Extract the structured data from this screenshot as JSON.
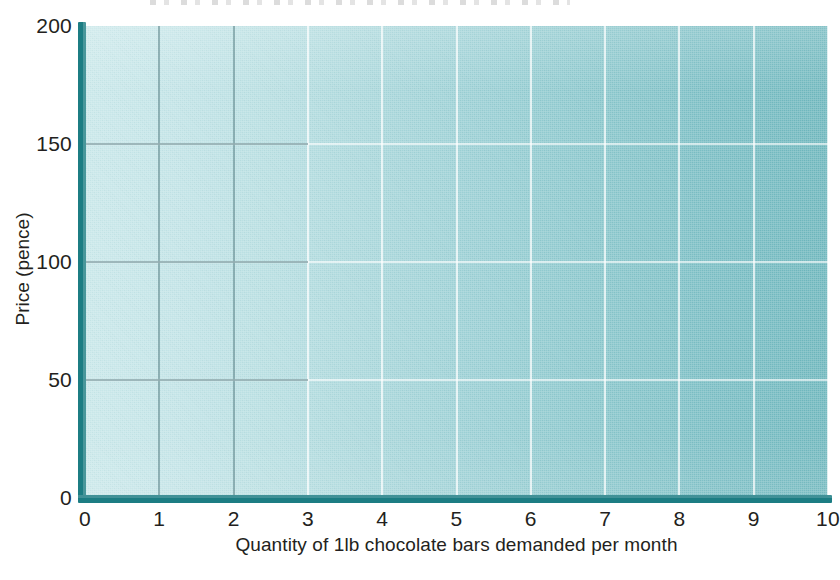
{
  "chart_data": {
    "type": "line",
    "title": "",
    "subtitle": "",
    "xlabel": "Quantity of 1lb chocolate bars demanded per month",
    "ylabel": "Price (pence)",
    "xlim": [
      0,
      10
    ],
    "ylim": [
      0,
      200
    ],
    "x_ticks": [
      0,
      1,
      2,
      3,
      4,
      5,
      6,
      7,
      8,
      9,
      10
    ],
    "x_tick_labels": [
      "0",
      "1",
      "2",
      "3",
      "4",
      "5",
      "6",
      "7",
      "8",
      "9",
      "10"
    ],
    "y_ticks": [
      0,
      50,
      100,
      150,
      200
    ],
    "y_tick_labels": [
      "0",
      "50",
      "100",
      "150",
      "200"
    ],
    "grid": true,
    "grid_axes": "both",
    "legend": false,
    "legend_position": "none",
    "series": [],
    "annotations": [],
    "colors": {
      "plot_fill_left": "#c9e8ea",
      "plot_fill_right": "#6eb7bd",
      "axis_line": "#1c7d83",
      "gridline_light": "#ffffff",
      "gridline_dark": "#5c8488",
      "text": "#231f20",
      "page_background": "#ffffff"
    }
  },
  "axes": {
    "x": {
      "title": "Quantity of 1lb chocolate bars demanded per month",
      "ticks": [
        {
          "value": 0,
          "label": "0"
        },
        {
          "value": 1,
          "label": "1"
        },
        {
          "value": 2,
          "label": "2"
        },
        {
          "value": 3,
          "label": "3"
        },
        {
          "value": 4,
          "label": "4"
        },
        {
          "value": 5,
          "label": "5"
        },
        {
          "value": 6,
          "label": "6"
        },
        {
          "value": 7,
          "label": "7"
        },
        {
          "value": 8,
          "label": "8"
        },
        {
          "value": 9,
          "label": "9"
        },
        {
          "value": 10,
          "label": "10"
        }
      ]
    },
    "y": {
      "title": "Price (pence)",
      "ticks": [
        {
          "value": 0,
          "label": "0"
        },
        {
          "value": 50,
          "label": "50"
        },
        {
          "value": 100,
          "label": "100"
        },
        {
          "value": 150,
          "label": "150"
        },
        {
          "value": 200,
          "label": "200"
        }
      ]
    }
  }
}
